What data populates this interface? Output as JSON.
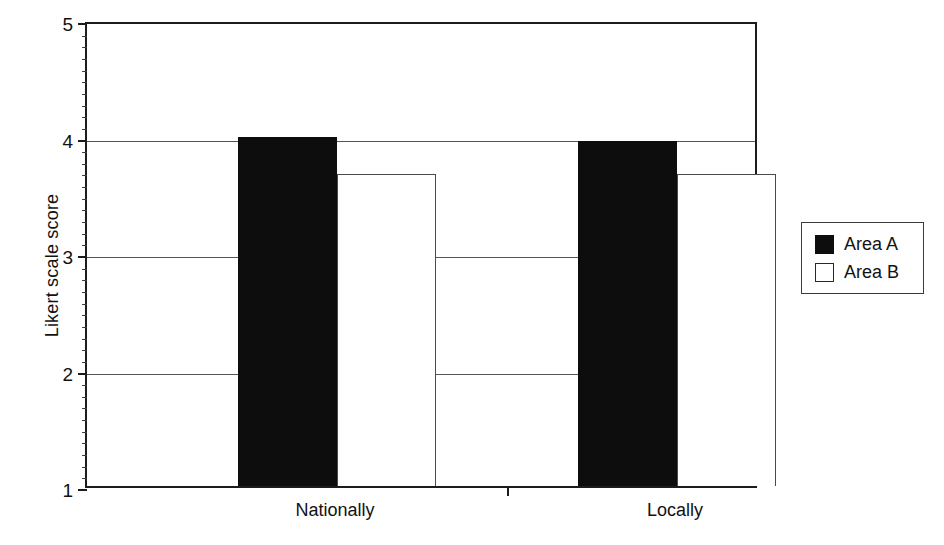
{
  "chart_data": {
    "type": "bar",
    "title": "",
    "subtitle": "",
    "xlabel": "",
    "ylabel": "Likert scale score",
    "categories": [
      "Nationally",
      "Locally"
    ],
    "series": [
      {
        "name": "Area A",
        "color": "#0d0d0d",
        "values": [
          4.0,
          3.96
        ]
      },
      {
        "name": "Area B",
        "color": "#ffffff",
        "values": [
          3.68,
          3.68
        ]
      }
    ],
    "ylim": [
      1,
      5
    ],
    "yticks": [
      1,
      2,
      3,
      4,
      5
    ],
    "ytick_labels": [
      "1",
      "2",
      "3",
      "4",
      "5"
    ],
    "minor_tick_step": 0.1,
    "grid": true,
    "grid_axis": "y",
    "legend_position": "right",
    "legend_entries": [
      "Area A",
      "Area B"
    ]
  },
  "axes": {
    "y_title": "Likert scale score"
  },
  "legend": {
    "items": [
      {
        "label": "Area A",
        "swatch": "filled-black-square"
      },
      {
        "label": "Area B",
        "swatch": "outlined-white-square"
      }
    ]
  }
}
